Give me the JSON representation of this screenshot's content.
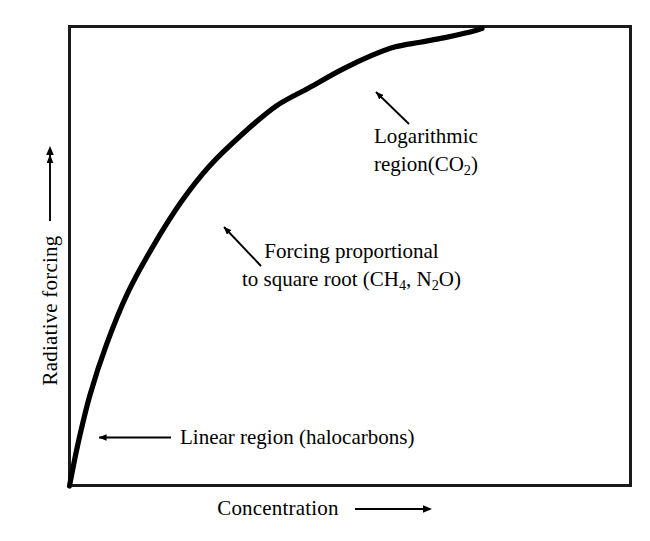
{
  "chart_data": {
    "type": "line",
    "title": "",
    "xlabel": "Concentration",
    "ylabel": "Radiative forcing",
    "xlabel_arrow": "right-arrow",
    "ylabel_arrow": "up-arrow",
    "grid": false,
    "legend": "none",
    "axis_ticks": "none",
    "xlim": [
      0,
      1
    ],
    "ylim": [
      0,
      1
    ],
    "series": [
      {
        "name": "Radiative forcing vs concentration",
        "description": "Concave-down saturating curve: linear at low concentration, square-root at intermediate, logarithmic at high concentration",
        "x": [
          0.0,
          0.02,
          0.05,
          0.09,
          0.14,
          0.2,
          0.27,
          0.34,
          0.42,
          0.5,
          0.58,
          0.66,
          0.73,
          0.79,
          0.85,
          0.91,
          0.96,
          1.0
        ],
        "y": [
          0.0,
          0.09,
          0.2,
          0.31,
          0.42,
          0.52,
          0.62,
          0.7,
          0.77,
          0.83,
          0.87,
          0.91,
          0.94,
          0.96,
          0.97,
          0.98,
          0.99,
          1.0
        ]
      }
    ],
    "annotations": [
      {
        "id": "logarithmic",
        "line1": "Logarithmic",
        "line2_prefix": "region(CO",
        "line2_sub": "2",
        "line2_suffix": ")",
        "arrow": "diagonal-up-left",
        "points_to": "upper curve segment"
      },
      {
        "id": "square-root",
        "line1": "Forcing proportional",
        "line2_part1": "to square root (CH",
        "line2_sub1": "4",
        "line2_part2": ", N",
        "line2_sub2": "2",
        "line2_part3": "O)",
        "arrow": "diagonal-up-left",
        "points_to": "middle curve segment"
      },
      {
        "id": "linear",
        "text": "Linear region (halocarbons)",
        "arrow": "left",
        "points_to": "lower curve segment"
      }
    ]
  },
  "figure": {
    "background_color": "#ffffff",
    "frame_color": "#1a1a1a",
    "curve_color": "#000000",
    "annotation_color": "#000000"
  }
}
